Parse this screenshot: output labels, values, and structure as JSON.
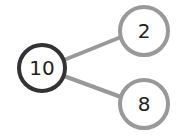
{
  "diagram": {
    "type": "number-bond",
    "whole": {
      "label": "10",
      "stroke": "#333333"
    },
    "parts": [
      {
        "label": "2",
        "stroke": "#999999"
      },
      {
        "label": "8",
        "stroke": "#999999"
      }
    ],
    "connector_color": "#999999"
  }
}
